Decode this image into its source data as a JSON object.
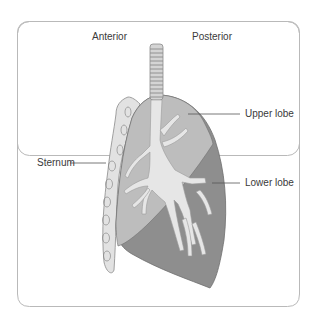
{
  "diagram": {
    "type": "anatomical-illustration",
    "labels": {
      "anterior": "Anterior",
      "posterior": "Posterior",
      "upper_lobe": "Upper lobe",
      "lower_lobe": "Lower lobe",
      "sternum": "Sternum"
    },
    "colors": {
      "frame_border": "#b9b9b9",
      "upper_lobe_fill": "#bdbdbd",
      "lower_lobe_fill": "#8e8e8e",
      "bronchi_fill": "#e6e6e6",
      "sternum_fill": "#e2e2e2",
      "outline": "#7a7a7a",
      "text": "#3a3a3a"
    }
  }
}
